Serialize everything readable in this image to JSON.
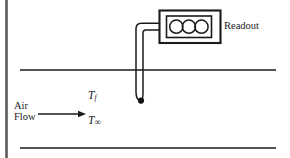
{
  "figure": {
    "background_color": "#ffffff",
    "line_color": "#1a1a1a",
    "width": 290,
    "height": 158
  },
  "labels": {
    "readout": "Readout",
    "air": "Air",
    "flow": "Flow",
    "temp_surface_symbol": "T",
    "temp_surface_subscript": "f",
    "temp_freestream_symbol": "T",
    "temp_freestream_subscript": "∞"
  },
  "readout_display": {
    "digits": [
      "0",
      "0",
      "0"
    ],
    "digit_count": 3
  },
  "geometry": {
    "upper_wall_y": 70,
    "lower_wall_y": 148,
    "wall_x_start": 20,
    "wall_x_end": 276,
    "probe_tip_x": 141,
    "probe_tip_y": 101,
    "arrow_y": 114,
    "arrow_x_start": 38,
    "arrow_x_end": 86,
    "edge_bar_x": 6
  }
}
